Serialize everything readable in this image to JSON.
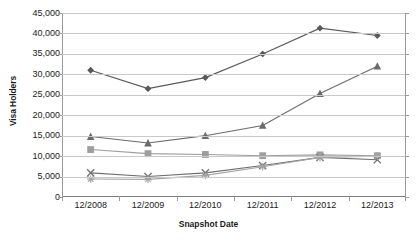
{
  "chart_data": {
    "type": "line",
    "title": "",
    "xlabel": "Snapshot Date",
    "ylabel": "Visa Holders",
    "categories": [
      "12/2008",
      "12/2009",
      "12/2010",
      "12/2011",
      "12/2012",
      "12/2013"
    ],
    "ylim": [
      0,
      45000
    ],
    "ytick_labels": [
      "45,000",
      "40,000",
      "35,000",
      "30,000",
      "25,000",
      "20,000",
      "15,000",
      "10,000",
      "5,000",
      "0"
    ],
    "ytick_values": [
      45000,
      40000,
      35000,
      30000,
      25000,
      20000,
      15000,
      10000,
      5000,
      0
    ],
    "ytick_interval": 5000,
    "grid": true,
    "legend": "none",
    "series": [
      {
        "name": "series-diamond",
        "marker": "diamond",
        "color": "#59595b",
        "values": [
          31000,
          26500,
          29200,
          35000,
          41300,
          39500
        ]
      },
      {
        "name": "series-triangle",
        "marker": "triangle",
        "color": "#6b6b6d",
        "values": [
          14800,
          13200,
          15000,
          17500,
          25300,
          32000
        ]
      },
      {
        "name": "series-square",
        "marker": "square",
        "color": "#9e9e9e",
        "values": [
          11600,
          10600,
          10400,
          10100,
          10300,
          10100
        ]
      },
      {
        "name": "series-cross",
        "marker": "x",
        "color": "#6f6f71",
        "values": [
          5900,
          5000,
          5900,
          7700,
          9700,
          9100
        ]
      },
      {
        "name": "series-star",
        "marker": "asterisk",
        "color": "#a5a5a5",
        "values": [
          4400,
          4300,
          5300,
          7400,
          9700,
          10000
        ]
      }
    ]
  }
}
